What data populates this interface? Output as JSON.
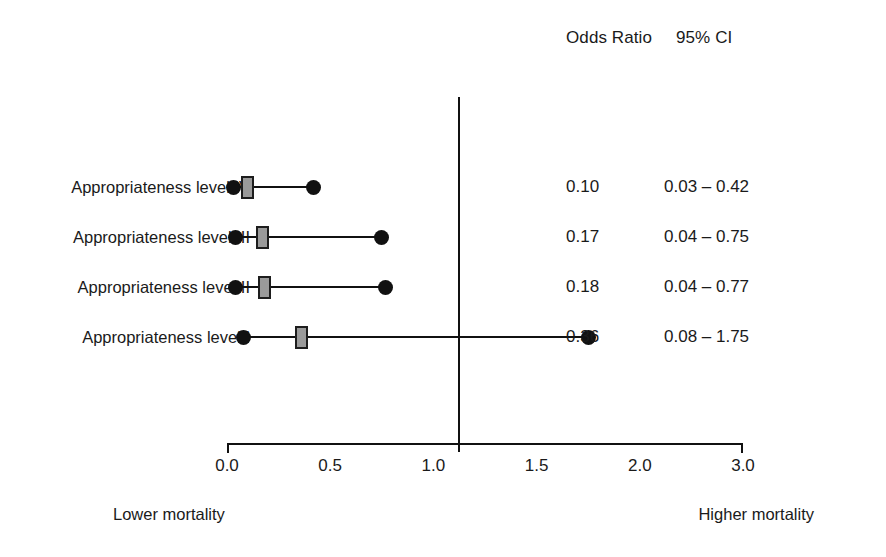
{
  "chart_data": {
    "type": "forest",
    "title": "",
    "columns": [
      "Odds Ratio",
      "95% CI"
    ],
    "categories": [
      "Appropriateness level IV",
      "Appropriateness level III",
      "Appropriateness level II",
      "Appropriateness level I"
    ],
    "odds_ratio": [
      0.1,
      0.17,
      0.18,
      0.36
    ],
    "ci_low": [
      0.03,
      0.04,
      0.04,
      0.08
    ],
    "ci_high": [
      0.42,
      0.75,
      0.77,
      1.75
    ],
    "odds_ratio_text": [
      "0.10",
      "0.17",
      "0.18",
      "0.36"
    ],
    "ci_text": [
      "0.03 – 0.42",
      "0.04 – 0.75",
      "0.04 – 0.77",
      "0.08 – 1.75"
    ],
    "null_value": 1.0,
    "xlabel": "",
    "ylabel": "",
    "xlim": [
      0.0,
      3.0
    ],
    "xticks": [
      0.0,
      0.5,
      1.0,
      1.5,
      2.0,
      3.0
    ],
    "xtick_labels": [
      "0.0",
      "0.5",
      "1.0",
      "1.5",
      "2.0",
      "3.0"
    ],
    "grid": false,
    "legend": "none",
    "marker_color": "#9a9a9a",
    "line_color": "#111111",
    "direction_left": "Lower mortality",
    "direction_right": "Higher mortality"
  },
  "header": {
    "odds_ratio_label": "Odds Ratio",
    "ci_label": "95% CI"
  },
  "rows": [
    {
      "label": "Appropriateness level IV",
      "or_text": "0.10",
      "ci_text": "0.03 – 0.42"
    },
    {
      "label": "Appropriateness level III",
      "or_text": "0.17",
      "ci_text": "0.04 – 0.75"
    },
    {
      "label": "Appropriateness level II",
      "or_text": "0.18",
      "ci_text": "0.04 – 0.77"
    },
    {
      "label": "Appropriateness level I",
      "or_text": "0.36",
      "ci_text": "0.08 – 1.75"
    }
  ],
  "axis": {
    "ticks": [
      "0.0",
      "0.5",
      "1.0",
      "1.5",
      "2.0",
      "3.0"
    ]
  },
  "footer": {
    "left": "Lower mortality",
    "right": "Higher mortality"
  }
}
